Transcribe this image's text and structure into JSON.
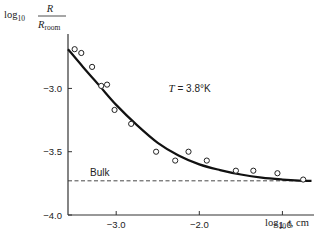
{
  "chart_data": {
    "type": "scatter",
    "title": "",
    "xlabel": "log10 t, cm",
    "xlabel_parts": {
      "prefix": "log",
      "sub": "10",
      "var": "t",
      "suffix": ", cm"
    },
    "ylabel": "log10 R/R_room",
    "ylabel_parts": {
      "prefix": "log",
      "sub": "10",
      "num": "R",
      "den": "R",
      "den_sub": "room"
    },
    "xlim": [
      -3.58,
      -0.62
    ],
    "ylim": [
      -4.0,
      -2.57
    ],
    "xticks": [
      -3.0,
      -2.0,
      -1.0
    ],
    "xtick_labels": [
      "−3.0",
      "−2.0",
      "−1.0"
    ],
    "yticks": [
      -3.0,
      -3.5,
      -4.0
    ],
    "ytick_labels": [
      "−3.0",
      "−3.5",
      "−4.0"
    ],
    "grid": false,
    "series": [
      {
        "name": "measured",
        "marker": "open-circle",
        "points": [
          [
            -3.5,
            -2.69
          ],
          [
            -3.42,
            -2.72
          ],
          [
            -3.29,
            -2.83
          ],
          [
            -3.18,
            -2.98
          ],
          [
            -3.11,
            -2.97
          ],
          [
            -3.02,
            -3.17
          ],
          [
            -2.82,
            -3.28
          ],
          [
            -2.52,
            -3.5
          ],
          [
            -2.29,
            -3.57
          ],
          [
            -2.13,
            -3.5
          ],
          [
            -1.91,
            -3.57
          ],
          [
            -1.56,
            -3.65
          ],
          [
            -1.35,
            -3.65
          ],
          [
            -1.06,
            -3.67
          ],
          [
            -0.75,
            -3.72
          ]
        ]
      },
      {
        "name": "fit",
        "style": "solid-thick",
        "points": [
          [
            -3.58,
            -2.69
          ],
          [
            -3.4,
            -2.83
          ],
          [
            -3.2,
            -2.98
          ],
          [
            -3.0,
            -3.13
          ],
          [
            -2.75,
            -3.29
          ],
          [
            -2.5,
            -3.43
          ],
          [
            -2.25,
            -3.53
          ],
          [
            -2.0,
            -3.6
          ],
          [
            -1.75,
            -3.645
          ],
          [
            -1.5,
            -3.68
          ],
          [
            -1.25,
            -3.705
          ],
          [
            -1.0,
            -3.72
          ],
          [
            -0.8,
            -3.728
          ],
          [
            -0.65,
            -3.73
          ]
        ]
      }
    ],
    "reference_line": {
      "label": "Bulk",
      "y": -3.73,
      "style": "dashed",
      "x_range": [
        -3.58,
        -0.75
      ]
    },
    "annotations": [
      {
        "text_var": "T",
        "text_rest": " = 3.8°K",
        "x": -2.37,
        "y": -3.0
      }
    ]
  }
}
